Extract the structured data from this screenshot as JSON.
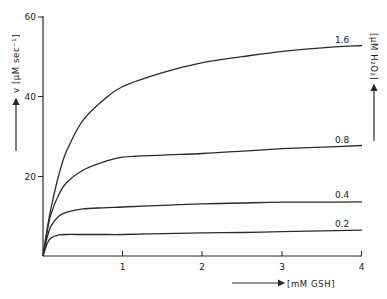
{
  "chart_data": {
    "type": "line",
    "title": "",
    "xlabel": "[mM GSH]",
    "ylabel": "v [μM sec⁻¹]",
    "right_label": "[μM H₂O₂]",
    "xlim": [
      0,
      4
    ],
    "ylim": [
      0,
      60
    ],
    "x_ticks": [
      1,
      2,
      3,
      4
    ],
    "y_ticks": [
      20,
      40,
      60
    ],
    "grid": false,
    "legend": "inline labels at right end of curves",
    "x": [
      0,
      0.05,
      0.1,
      0.2,
      0.3,
      0.5,
      0.75,
      1.0,
      1.5,
      2.0,
      2.5,
      3.0,
      3.5,
      4.0
    ],
    "series": [
      {
        "name": "1.6",
        "values": [
          0,
          6.5,
          12,
          20.5,
          26.5,
          34,
          39,
          42.5,
          46,
          48.5,
          50,
          51.3,
          52.2,
          52.8
        ]
      },
      {
        "name": "0.8",
        "values": [
          0,
          6,
          10.5,
          15.5,
          18.5,
          21.5,
          23.5,
          24.8,
          25.3,
          25.7,
          26.3,
          26.9,
          27.3,
          27.7
        ]
      },
      {
        "name": "0.4",
        "values": [
          0,
          4.5,
          7.5,
          10,
          11,
          11.8,
          12.1,
          12.3,
          12.7,
          13.1,
          13.3,
          13.5,
          13.5,
          13.6
        ]
      },
      {
        "name": "0.2",
        "values": [
          0,
          3,
          4.5,
          5.3,
          5.4,
          5.4,
          5.4,
          5.4,
          5.6,
          5.8,
          5.9,
          6.1,
          6.3,
          6.5
        ]
      }
    ]
  },
  "labels": {
    "y_axis": "v [μM sec⁻¹]",
    "right_axis": "[μM H₂O₂]",
    "x_axis": "[mM GSH]",
    "y_ticks": [
      "20",
      "40",
      "60"
    ],
    "x_ticks": [
      "1",
      "2",
      "3",
      "4"
    ],
    "curves": [
      "1.6",
      "0.8",
      "0.4",
      "0.2"
    ]
  }
}
